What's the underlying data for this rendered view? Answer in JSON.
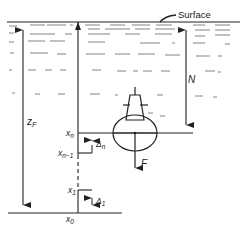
{
  "diagram": {
    "surface_label": "Surface",
    "labels": {
      "zF": "z",
      "zF_sub": "F",
      "N": "N",
      "F": "F",
      "xn": "x",
      "xn_sub": "n",
      "xn1": "x",
      "xn1_sub": "n−1",
      "x1": "x",
      "x1_sub": "1",
      "x0": "x",
      "x0_sub": "0",
      "delta_n": "Δ",
      "delta_n_sub": "n",
      "delta_1": "Δ",
      "delta_1_sub": "1"
    },
    "colors": {
      "ink": "#222222",
      "water_dash": "#555555",
      "background": "#ffffff"
    }
  }
}
